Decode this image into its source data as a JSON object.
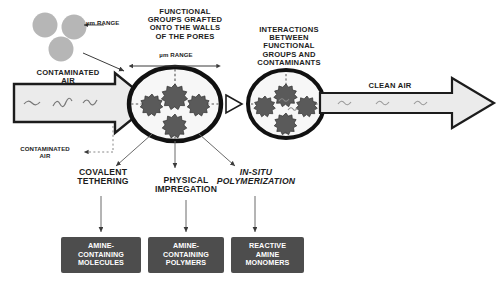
{
  "diagram": {
    "title_labels": {
      "functional_groups": "FUNCTIONAL\nGROUPS GRAFTED\nONTO THE WALLS\nOF THE PORES",
      "interactions": "INTERACTIONS\nBETWEEN\nFUNCTIONAL\nGROUPS AND\nCONTAMINANTS"
    },
    "scale_labels": {
      "particle_range": "µm RANGE",
      "pore_range": "µm RANGE"
    },
    "flow": {
      "inlet_label": "CONTAMINATED\nAIR",
      "outlet_label": "CLEAN AIR",
      "captured_label": "CONTAMINATED\nAIR"
    },
    "routes": [
      {
        "label": "COVALENT\nTETHERING",
        "italic": false
      },
      {
        "label": "PHYSICAL\nIMPREGATION",
        "italic": false
      },
      {
        "label": "IN-SITU\nPOLYMERIZATION",
        "italic": true
      }
    ],
    "products": [
      {
        "label": "AMINE-\nCONTAINING\nMOLECULES"
      },
      {
        "label": "AMINE-\nCONTAINING\nPOLYMERS"
      },
      {
        "label": "REACTIVE\nAMINE\nMONOMERS"
      }
    ],
    "colors": {
      "ink": "#1c1c1c",
      "box_fill": "#4d4d4d",
      "box_text": "#ffffff",
      "particle_gray": "#b4b4b4",
      "functional_group": "#5a5a5a",
      "pore_fill": "#f7f7f7",
      "arrow_fill": "#ebebeb"
    }
  }
}
